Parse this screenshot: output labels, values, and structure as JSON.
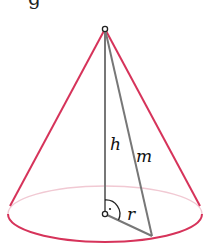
{
  "figure": {
    "type": "cone",
    "labels": {
      "height": "h",
      "slant": "m",
      "radius": "r"
    },
    "top_cutoff_text": "g",
    "colors": {
      "outline": "#d6335a",
      "back_arc": "#f1c9d3",
      "inner_lines": "#777777",
      "labels": "#111111"
    },
    "geometry": {
      "apex": [
        105,
        29
      ],
      "base_center": [
        105,
        214
      ],
      "base_rx": 97,
      "base_ry": 28,
      "radius_end": [
        152,
        236
      ]
    }
  }
}
